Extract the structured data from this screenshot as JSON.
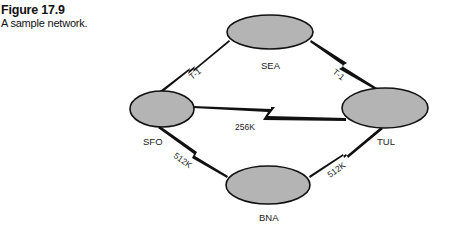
{
  "caption": {
    "figure_number": "Figure 17.9",
    "title": "A sample network."
  },
  "colors": {
    "node_fill": "#b4b4b4",
    "stroke": "#111111",
    "background": "#ffffff"
  },
  "nodes": [
    {
      "id": "SEA",
      "label": "SEA"
    },
    {
      "id": "SFO",
      "label": "SFO"
    },
    {
      "id": "TUL",
      "label": "TUL"
    },
    {
      "id": "BNA",
      "label": "BNA"
    }
  ],
  "links": [
    {
      "from": "SFO",
      "to": "SEA",
      "label": "T-1"
    },
    {
      "from": "SEA",
      "to": "TUL",
      "label": "T-1"
    },
    {
      "from": "SFO",
      "to": "TUL",
      "label": "256K"
    },
    {
      "from": "SFO",
      "to": "BNA",
      "label": "512K"
    },
    {
      "from": "BNA",
      "to": "TUL",
      "label": "512K"
    }
  ]
}
